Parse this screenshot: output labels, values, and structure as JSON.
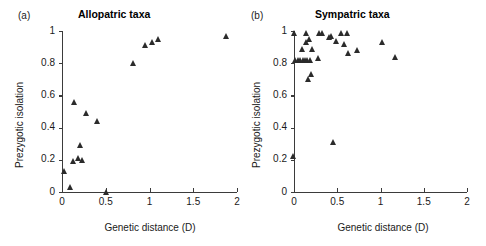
{
  "figure": {
    "axis_color": "#3b3b3b",
    "marker_color": "#2b2b2b"
  },
  "chart_data": [
    {
      "type": "scatter",
      "panel_tag": "(a)",
      "title": "Allopatric taxa",
      "xlabel": "Genetic distance (D)",
      "ylabel": "Prezygotic isolation",
      "xlim": [
        0,
        2
      ],
      "ylim": [
        0,
        1
      ],
      "xticks": [
        0,
        0.5,
        1,
        1.5,
        2
      ],
      "xticklabels": [
        "0",
        "0.5",
        "1",
        "1.5",
        "2"
      ],
      "yticks": [
        0,
        0.2,
        0.4,
        0.6,
        0.8,
        1
      ],
      "yticklabels": [
        "0",
        "0.2",
        "0.4",
        "0.6",
        "0.8",
        "1"
      ],
      "grid": false,
      "legend": null,
      "marker": "triangle-up",
      "points": [
        {
          "x": 0.03,
          "y": 0.13
        },
        {
          "x": 0.1,
          "y": 0.03
        },
        {
          "x": 0.13,
          "y": 0.19
        },
        {
          "x": 0.14,
          "y": 0.56
        },
        {
          "x": 0.19,
          "y": 0.21
        },
        {
          "x": 0.21,
          "y": 0.29
        },
        {
          "x": 0.23,
          "y": 0.2
        },
        {
          "x": 0.28,
          "y": 0.49
        },
        {
          "x": 0.41,
          "y": 0.44
        },
        {
          "x": 0.51,
          "y": 0.0
        },
        {
          "x": 0.82,
          "y": 0.8
        },
        {
          "x": 0.95,
          "y": 0.91
        },
        {
          "x": 1.04,
          "y": 0.93
        },
        {
          "x": 1.1,
          "y": 0.95
        },
        {
          "x": 1.88,
          "y": 0.97
        }
      ]
    },
    {
      "type": "scatter",
      "panel_tag": "(b)",
      "title": "Sympatric taxa",
      "xlabel": "Genetic distance (D)",
      "ylabel": "Prezygotic isolation",
      "xlim": [
        0,
        2
      ],
      "ylim": [
        0,
        1
      ],
      "xticks": [
        0,
        0.5,
        1,
        1.5,
        2
      ],
      "xticklabels": [
        "0",
        "0.5",
        "1",
        "1.5",
        "2"
      ],
      "yticks": [
        0,
        0.2,
        0.4,
        0.6,
        0.8,
        1
      ],
      "yticklabels": [
        "0",
        "0.2",
        "0.4",
        "0.6",
        "0.8",
        "1"
      ],
      "grid": false,
      "legend": null,
      "marker": "triangle-up",
      "points": [
        {
          "x": 0.0,
          "y": 0.22
        },
        {
          "x": 0.01,
          "y": 0.99
        },
        {
          "x": 0.02,
          "y": 0.82
        },
        {
          "x": 0.05,
          "y": 0.82
        },
        {
          "x": 0.08,
          "y": 0.82
        },
        {
          "x": 0.1,
          "y": 0.89
        },
        {
          "x": 0.11,
          "y": 0.82
        },
        {
          "x": 0.13,
          "y": 0.82
        },
        {
          "x": 0.14,
          "y": 0.93
        },
        {
          "x": 0.15,
          "y": 0.99
        },
        {
          "x": 0.16,
          "y": 0.82
        },
        {
          "x": 0.17,
          "y": 0.7
        },
        {
          "x": 0.18,
          "y": 0.95
        },
        {
          "x": 0.19,
          "y": 0.82
        },
        {
          "x": 0.2,
          "y": 0.73
        },
        {
          "x": 0.21,
          "y": 0.89
        },
        {
          "x": 0.28,
          "y": 0.83
        },
        {
          "x": 0.3,
          "y": 0.99
        },
        {
          "x": 0.33,
          "y": 0.99
        },
        {
          "x": 0.41,
          "y": 0.96
        },
        {
          "x": 0.43,
          "y": 0.97
        },
        {
          "x": 0.46,
          "y": 0.31
        },
        {
          "x": 0.49,
          "y": 0.94
        },
        {
          "x": 0.55,
          "y": 0.99
        },
        {
          "x": 0.58,
          "y": 0.92
        },
        {
          "x": 0.62,
          "y": 0.99
        },
        {
          "x": 0.63,
          "y": 0.86
        },
        {
          "x": 0.74,
          "y": 0.88
        },
        {
          "x": 1.03,
          "y": 0.93
        },
        {
          "x": 1.17,
          "y": 0.84
        }
      ]
    }
  ]
}
